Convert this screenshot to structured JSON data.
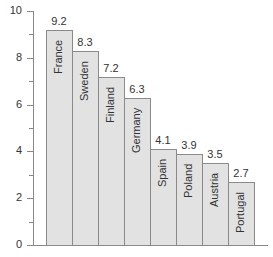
{
  "chart_data": {
    "type": "bar",
    "title": "",
    "xlabel": "",
    "ylabel": "",
    "categories": [
      "France",
      "Sweden",
      "Finland",
      "Germany",
      "Spain",
      "Poland",
      "Austria",
      "Portugal"
    ],
    "values": [
      9.2,
      8.3,
      7.2,
      6.3,
      4.1,
      3.9,
      3.5,
      2.7
    ],
    "value_labels": [
      "9.2",
      "8.3",
      "7.2",
      "6.3",
      "4.1",
      "3.9",
      "3.5",
      "2.7"
    ],
    "ylim": [
      0,
      10
    ],
    "yticks": [
      "0",
      "2",
      "4",
      "6",
      "8",
      "10"
    ],
    "minor_yticks": [
      1,
      3,
      5,
      7,
      9
    ],
    "grid": false,
    "legend": null,
    "bar_color": "#e2e2e2",
    "bar_edge_color": "#8a8a8a",
    "category_labels_inside_bars_rotated": true
  }
}
